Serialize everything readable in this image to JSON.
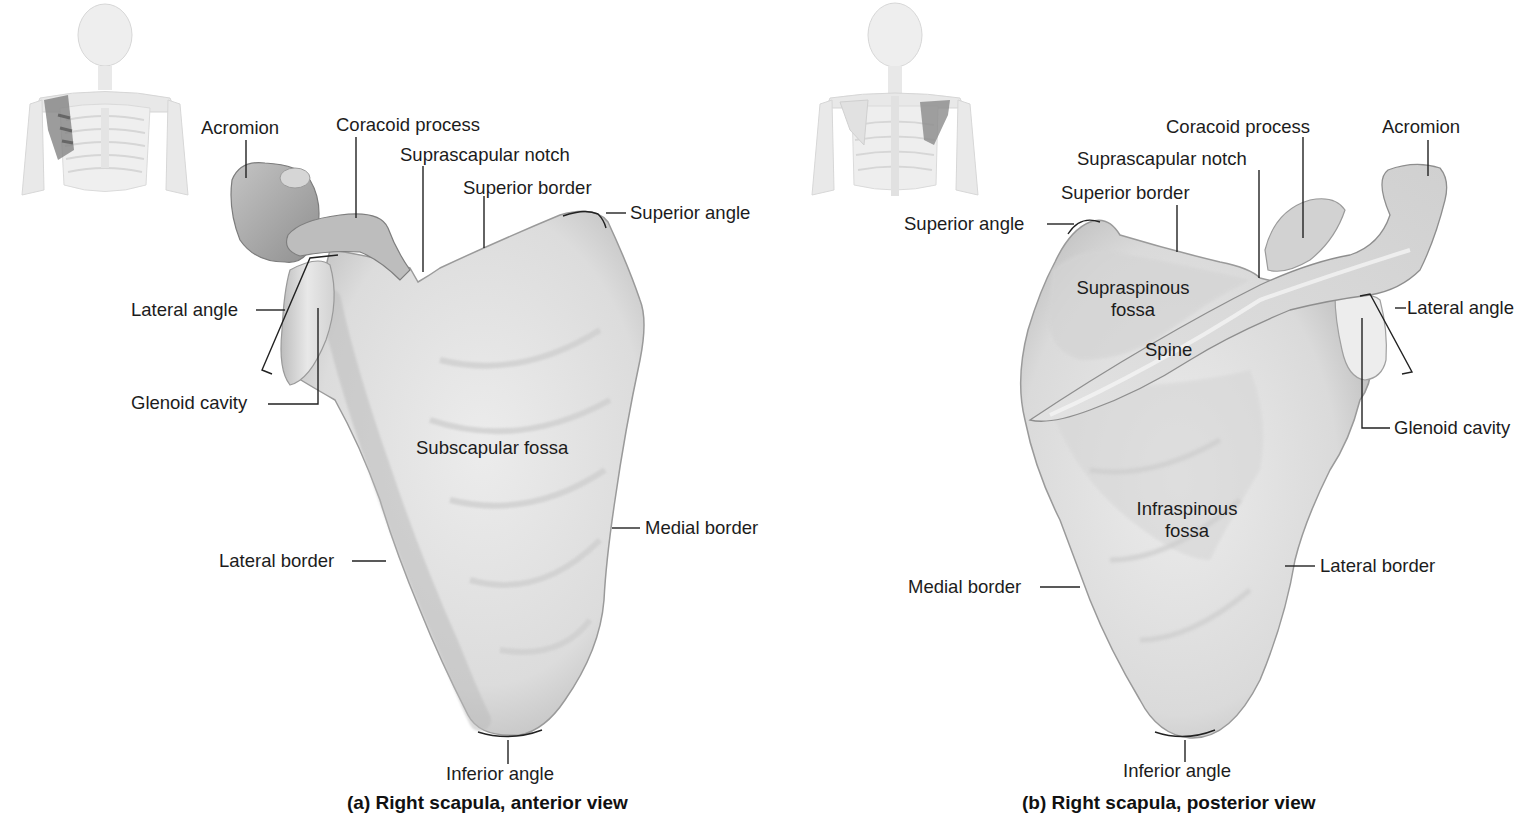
{
  "figure_a": {
    "caption": "(a) Right scapula, anterior view",
    "view": "anterior",
    "thumbnail": "anterior-skeleton-thumbnail",
    "labels": {
      "acromion": "Acromion",
      "coracoid_process": "Coracoid process",
      "suprascapular_notch": "Suprascapular notch",
      "superior_border": "Superior border",
      "superior_angle": "Superior angle",
      "lateral_angle": "Lateral angle",
      "glenoid_cavity": "Glenoid cavity",
      "subscapular_fossa": "Subscapular fossa",
      "medial_border": "Medial border",
      "lateral_border": "Lateral border",
      "inferior_angle": "Inferior angle"
    }
  },
  "figure_b": {
    "caption": "(b) Right scapula, posterior view",
    "view": "posterior",
    "thumbnail": "posterior-skeleton-thumbnail",
    "labels": {
      "coracoid_process": "Coracoid process",
      "acromion": "Acromion",
      "suprascapular_notch": "Suprascapular notch",
      "superior_border": "Superior border",
      "superior_angle": "Superior angle",
      "supraspinous_fossa_1": "Supraspinous",
      "supraspinous_fossa_2": "fossa",
      "spine": "Spine",
      "lateral_angle": "Lateral angle",
      "glenoid_cavity": "Glenoid cavity",
      "infraspinous_fossa_1": "Infraspinous",
      "infraspinous_fossa_2": "fossa",
      "medial_border": "Medial border",
      "lateral_border": "Lateral border",
      "inferior_angle": "Inferior angle"
    }
  },
  "colors": {
    "bone_light": "#e6e6e6",
    "bone_mid": "#cfcfcf",
    "bone_dark": "#a8a8a8",
    "highlight_scapula": "#7a7a7a",
    "leader_line": "#222222",
    "text": "#1c1c1c"
  }
}
